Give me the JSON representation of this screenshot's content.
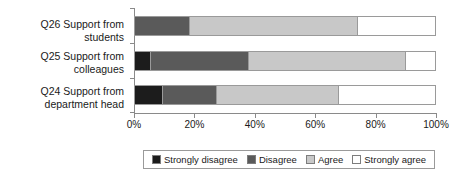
{
  "chart_data": {
    "type": "bar",
    "orientation": "horizontal",
    "stacked": true,
    "stack_mode": "percent",
    "title": "",
    "xlabel": "",
    "ylabel": "",
    "xlim": [
      0,
      100
    ],
    "grid": false,
    "legend_position": "bottom",
    "xtick_labels": [
      "0%",
      "20%",
      "40%",
      "60%",
      "80%",
      "100%"
    ],
    "xtick_values": [
      0,
      20,
      40,
      60,
      80,
      100
    ],
    "categories": [
      "Q26 Support from students",
      "Q25 Support from\ncolleagues",
      "Q24 Support from\ndepartment head"
    ],
    "series": [
      {
        "name": "Strongly disagree",
        "color": "#1c1c1c",
        "values": [
          0,
          5,
          9
        ]
      },
      {
        "name": "Disagree",
        "color": "#5a5a5a",
        "values": [
          18,
          32.5,
          18
        ]
      },
      {
        "name": "Agree",
        "color": "#c8c8c8",
        "values": [
          56,
          52.5,
          40.5
        ]
      },
      {
        "name": "Strongly agree",
        "color": "#ffffff",
        "values": [
          26,
          10,
          32.5
        ]
      }
    ]
  },
  "legend": {
    "items": [
      {
        "label": "Strongly disagree",
        "color": "#1c1c1c"
      },
      {
        "label": "Disagree",
        "color": "#5a5a5a"
      },
      {
        "label": "Agree",
        "color": "#c8c8c8"
      },
      {
        "label": "Strongly agree",
        "color": "#ffffff"
      }
    ]
  }
}
